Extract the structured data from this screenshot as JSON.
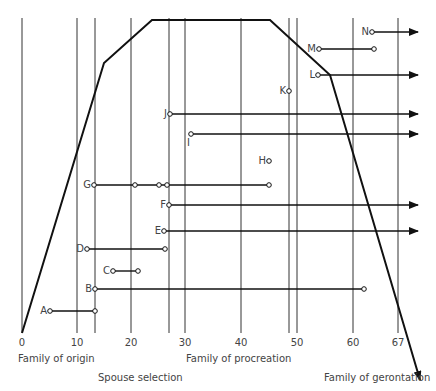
{
  "axis": {
    "ticks": [
      {
        "label": "0",
        "x": 22
      },
      {
        "label": "10",
        "x": 77
      },
      {
        "label": "20",
        "x": 131
      },
      {
        "label": "30",
        "x": 185
      },
      {
        "label": "40",
        "x": 241
      },
      {
        "label": "50",
        "x": 297
      },
      {
        "label": "60",
        "x": 353
      },
      {
        "label": "67",
        "x": 398
      }
    ],
    "vertical_lines_x": [
      22,
      77,
      95,
      131,
      169,
      185,
      241,
      289,
      297,
      353,
      398
    ]
  },
  "phases": {
    "family_of_origin": "Family of origin",
    "spouse_selection": "Spouse selection",
    "family_of_procreation": "Family of procreation",
    "family_of_gerontation": "Family of gerontation"
  },
  "points": [
    {
      "label": "N",
      "x": 372,
      "y": 32,
      "end_x": 418,
      "arrow": true
    },
    {
      "label": "M",
      "x": 319,
      "y": 49,
      "end_x": 374,
      "arrow": false
    },
    {
      "label": "L",
      "x": 318,
      "y": 75,
      "end_x": 418,
      "arrow": true
    },
    {
      "label": "K",
      "x": 289,
      "y": 91,
      "end_x": null,
      "arrow": false
    },
    {
      "label": "J",
      "x": 170,
      "y": 114,
      "end_x": 418,
      "arrow": true
    },
    {
      "label": "I",
      "x": 191,
      "y": 134,
      "end_x": 418,
      "arrow": true
    },
    {
      "label": "H",
      "x": 269,
      "y": 161,
      "end_x": null,
      "arrow": false
    },
    {
      "label": "G",
      "x": 94,
      "y": 185,
      "end_x": 269,
      "arrow": false,
      "mid": [
        135,
        159,
        167
      ]
    },
    {
      "label": "F",
      "x": 169,
      "y": 205,
      "end_x": 418,
      "arrow": true
    },
    {
      "label": "E",
      "x": 164,
      "y": 231,
      "end_x": 418,
      "arrow": true
    },
    {
      "label": "D",
      "x": 87,
      "y": 249,
      "end_x": 165,
      "arrow": false
    },
    {
      "label": "C",
      "x": 113,
      "y": 271,
      "end_x": 138,
      "arrow": false
    },
    {
      "label": "B",
      "x": 95,
      "y": 289,
      "end_x": 364,
      "arrow": false
    },
    {
      "label": "A",
      "x": 50,
      "y": 311,
      "end_x": 95,
      "arrow": false
    }
  ],
  "curve": [
    [
      22,
      333
    ],
    [
      104,
      63
    ],
    [
      152,
      20
    ],
    [
      270,
      20
    ],
    [
      330,
      75
    ],
    [
      420,
      380
    ]
  ],
  "colors": {
    "line": "#111111",
    "grid": "#333333",
    "text": "#444444"
  }
}
